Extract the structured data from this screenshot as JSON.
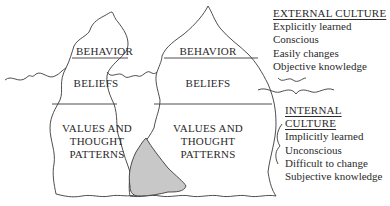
{
  "diagram": {
    "type": "iceberg-model",
    "left_iceberg": {
      "layers": [
        "BEHAVIOR",
        "BELIEFS",
        "VALUES AND THOUGHT PATTERNS"
      ],
      "behavior": "BEHAVIOR",
      "beliefs": "BELIEFS",
      "values_line1": "VALUES AND",
      "values_line2": "THOUGHT",
      "values_line3": "PATTERNS"
    },
    "right_iceberg": {
      "layers": [
        "BEHAVIOR",
        "BELIEFS",
        "VALUES AND THOUGHT PATTERNS"
      ],
      "behavior": "BEHAVIOR",
      "beliefs": "BELIEFS",
      "values_line1": "VALUES AND",
      "values_line2": "THOUGHT",
      "values_line3": "PATTERNS"
    },
    "overlap_fill": "#c8c8c8",
    "line_color": "#3a3a3a"
  },
  "legend": {
    "external": {
      "title": "EXTERNAL CULTURE",
      "items": [
        "Explicitly learned",
        "Conscious",
        "Easily changes",
        "Objective knowledge"
      ]
    },
    "internal": {
      "title": "INTERNAL CULTURE",
      "items": [
        "Implicitly learned",
        "Unconscious",
        "Difficult to change",
        "Subjective knowledge"
      ]
    }
  }
}
